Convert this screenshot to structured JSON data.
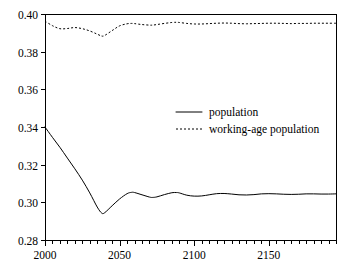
{
  "chart_data": {
    "type": "line",
    "title": "",
    "subtitle": "",
    "xlabel": "",
    "ylabel": "",
    "xlim": [
      2000,
      2195
    ],
    "ylim": [
      0.28,
      0.4
    ],
    "grid": false,
    "legend_position": "inside-center-right",
    "x_ticks": [
      2000,
      2050,
      2100,
      2150
    ],
    "x_tick_labels": [
      "2000",
      "2050",
      "2100",
      "2150"
    ],
    "x_minor_tick_interval": 5,
    "y_ticks": [
      0.28,
      0.3,
      0.32,
      0.34,
      0.36,
      0.38,
      0.4
    ],
    "y_tick_labels": [
      "0.28",
      "0.30",
      "0.32",
      "0.34",
      "0.36",
      "0.38",
      "0.40"
    ],
    "x": [
      2000,
      2005,
      2010,
      2015,
      2020,
      2025,
      2030,
      2035,
      2038,
      2040,
      2045,
      2050,
      2055,
      2058,
      2060,
      2065,
      2070,
      2072,
      2075,
      2080,
      2085,
      2088,
      2090,
      2095,
      2100,
      2105,
      2110,
      2115,
      2120,
      2125,
      2130,
      2135,
      2140,
      2145,
      2150,
      2155,
      2160,
      2165,
      2170,
      2175,
      2180,
      2185,
      2190,
      2195
    ],
    "series": [
      {
        "name": "population",
        "style": "solid",
        "color": "#000000",
        "values": [
          0.34,
          0.3345,
          0.3292,
          0.3235,
          0.3178,
          0.3118,
          0.305,
          0.2975,
          0.2943,
          0.2945,
          0.2982,
          0.3018,
          0.3046,
          0.3053,
          0.3052,
          0.304,
          0.3028,
          0.3026,
          0.3029,
          0.3041,
          0.3051,
          0.3052,
          0.305,
          0.3038,
          0.3033,
          0.3034,
          0.304,
          0.3046,
          0.3047,
          0.3044,
          0.304,
          0.3039,
          0.3041,
          0.3045,
          0.3046,
          0.3045,
          0.3043,
          0.3042,
          0.3043,
          0.3045,
          0.3045,
          0.3044,
          0.3044,
          0.3045
        ]
      },
      {
        "name": "working-age population",
        "style": "dotted",
        "color": "#000000",
        "values": [
          0.3962,
          0.3938,
          0.3922,
          0.3923,
          0.3928,
          0.3922,
          0.391,
          0.3893,
          0.3883,
          0.3886,
          0.3912,
          0.3937,
          0.3948,
          0.395,
          0.3949,
          0.3944,
          0.3941,
          0.3941,
          0.3944,
          0.395,
          0.3955,
          0.3956,
          0.3955,
          0.395,
          0.3947,
          0.3947,
          0.3949,
          0.3951,
          0.3952,
          0.3951,
          0.3949,
          0.3948,
          0.3949,
          0.395,
          0.3951,
          0.3951,
          0.395,
          0.3949,
          0.395,
          0.395,
          0.3951,
          0.3951,
          0.3951,
          0.3951
        ]
      }
    ]
  },
  "legend": {
    "entries": [
      {
        "label": "population",
        "style": "solid"
      },
      {
        "label": "working-age population",
        "style": "dotted"
      }
    ]
  },
  "axes": {
    "left": 45,
    "right": 336,
    "top": 14,
    "bottom": 240
  }
}
